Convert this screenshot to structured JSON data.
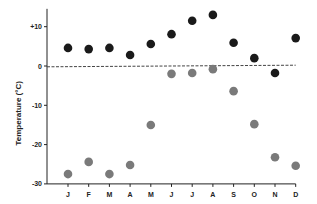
{
  "chart_data": {
    "type": "scatter",
    "title": "",
    "xlabel": "",
    "ylabel": "Temperature  (°C)",
    "categories": [
      "J",
      "F",
      "M",
      "A",
      "M",
      "J",
      "J",
      "A",
      "S",
      "O",
      "N",
      "D"
    ],
    "ylim": [
      -30,
      12
    ],
    "yticks": [
      10,
      0,
      -10,
      -20,
      -30
    ],
    "ytick_labels": [
      "+10",
      "0",
      "-10",
      "-20",
      "-30"
    ],
    "grid": false,
    "reference_line": {
      "value": 0,
      "style": "dashed"
    },
    "series": [
      {
        "name": "series-dark",
        "color": "#1a1a1a",
        "values": [
          4.6,
          4.3,
          4.6,
          2.8,
          5.6,
          8.1,
          11.5,
          13.0,
          5.9,
          2.0,
          -1.8,
          7.1
        ]
      },
      {
        "name": "series-grey",
        "color": "#7a7a7a",
        "values": [
          -27.5,
          -24.4,
          -27.5,
          -25.2,
          -15.0,
          -2.0,
          -1.8,
          -0.8,
          -6.4,
          -14.8,
          -23.2,
          -25.4
        ]
      }
    ]
  }
}
